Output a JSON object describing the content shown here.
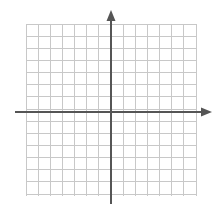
{
  "figure": {
    "kind": "cartesian-coordinate-grid",
    "title": "",
    "width": 222,
    "height": 209,
    "background_color": "#ffffff"
  },
  "chart_data": {
    "type": "scatter",
    "title": "",
    "subtitle": "",
    "xlabel": "",
    "ylabel": "",
    "series": [],
    "x": [],
    "values": [],
    "annotations": [],
    "legend": {
      "entries": [],
      "position": "none",
      "visible": false
    },
    "grid": {
      "visible": true,
      "columns": 14,
      "rows": 14,
      "cell_size_px": 12.143,
      "left_px": 26,
      "top_px": 24,
      "right_px": 196,
      "bottom_px": 196,
      "line_color": "#c8c8c8",
      "line_width_px": 1
    },
    "xlim": [
      -7,
      7
    ],
    "ylim": [
      -7,
      7
    ],
    "xticks": [
      -7,
      -6,
      -5,
      -4,
      -3,
      -2,
      -1,
      0,
      1,
      2,
      3,
      4,
      5,
      6,
      7
    ],
    "yticks": [
      -7,
      -6,
      -5,
      -4,
      -3,
      -2,
      -1,
      0,
      1,
      2,
      3,
      4,
      5,
      6,
      7
    ],
    "xticklabels": [],
    "yticklabels": [],
    "tick_labels_visible": false,
    "axes": {
      "color": "#555555",
      "line_width_px": 2,
      "origin_px": {
        "x": 111,
        "y": 112
      },
      "x_axis": {
        "start_px": 15,
        "end_px": 212,
        "arrow_start": false,
        "arrow_end": true,
        "direction": "horizontal"
      },
      "y_axis": {
        "start_px": 10,
        "end_px": 204,
        "arrow_start": true,
        "arrow_end": false,
        "direction": "vertical"
      }
    }
  }
}
